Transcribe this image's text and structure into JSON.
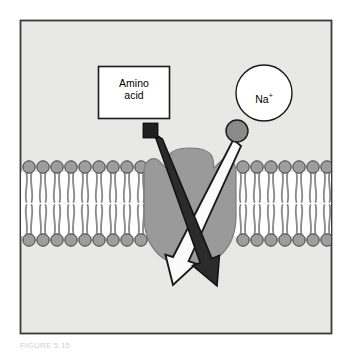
{
  "figure": {
    "caption": "FIGURE 5.15",
    "panel_background": "#e8e8e6",
    "frame_color": "#3a3a3a",
    "page_background": "#ffffff"
  },
  "labels": {
    "amino_acid": "Amino\nacid",
    "sodium_symbol": "Na",
    "sodium_charge": "+"
  },
  "legend_boxes": {
    "amino_acid_box": {
      "name": "Amino acid",
      "shape": "rectangle",
      "fill": "#ffffff",
      "stroke": "#1a1a1a",
      "x": 98,
      "y": 66,
      "width": 72,
      "height": 53
    },
    "sodium_circle": {
      "name": "Na +",
      "shape": "circle",
      "fill": "#ffffff",
      "stroke": "#1a1a1a",
      "cx": 264,
      "cy": 93,
      "r": 28
    }
  },
  "solutes": {
    "amino_acid_particle": {
      "shape": "square",
      "fill": "#1f1f1f",
      "x": 143,
      "y": 123,
      "size": 15
    },
    "sodium_particle": {
      "shape": "circle",
      "fill": "#8a8a8a",
      "stroke": "#1a1a1a",
      "cx": 237,
      "cy": 131,
      "r": 11
    }
  },
  "membrane": {
    "name": "phospholipid bilayer",
    "head_fill": "#9d9d9d",
    "head_stroke": "#3d3d3d",
    "tail_color": "#8d8d8d",
    "interior_fill": "#ffffff",
    "top_y": 167,
    "bottom_y": 240,
    "head_radius": 6.2,
    "head_spacing": 14.0,
    "left_segment": {
      "start_x": 22,
      "end_x": 150,
      "head_count": 10
    },
    "right_segment": {
      "start_x": 236,
      "end_x": 330,
      "head_count": 8
    }
  },
  "transport_protein": {
    "name": "carrier protein",
    "fill": "#9a9a9a",
    "stroke": "#6e6e6e",
    "cx": 190,
    "cy": 207,
    "rx": 44,
    "ry": 58
  },
  "arrows": [
    {
      "name": "amino-acid-transport-arrow",
      "solute": "Amino acid",
      "fill": "#2b2b2b",
      "stroke": "#141414",
      "direction": "inward",
      "from": "top-left",
      "to": "bottom-right",
      "x1": 158,
      "y1": 136,
      "x2": 216,
      "y2": 274
    },
    {
      "name": "sodium-transport-arrow",
      "solute": "Na +",
      "fill": "#fbfbfb",
      "stroke": "#1a1a1a",
      "direction": "inward",
      "from": "top-right",
      "to": "bottom-left",
      "x1": 229,
      "y1": 143,
      "x2": 172,
      "y2": 274
    }
  ],
  "colors": {
    "panel": "#e8e8e6",
    "frame": "#3a3a3a",
    "protein": "#9a9a9a",
    "lipid_head": "#9d9d9d",
    "lipid_tail": "#8d8d8d",
    "dark_arrow": "#2b2b2b",
    "light_arrow": "#fbfbfb",
    "amino_acid_particle": "#1f1f1f",
    "sodium_particle": "#8a8a8a"
  }
}
